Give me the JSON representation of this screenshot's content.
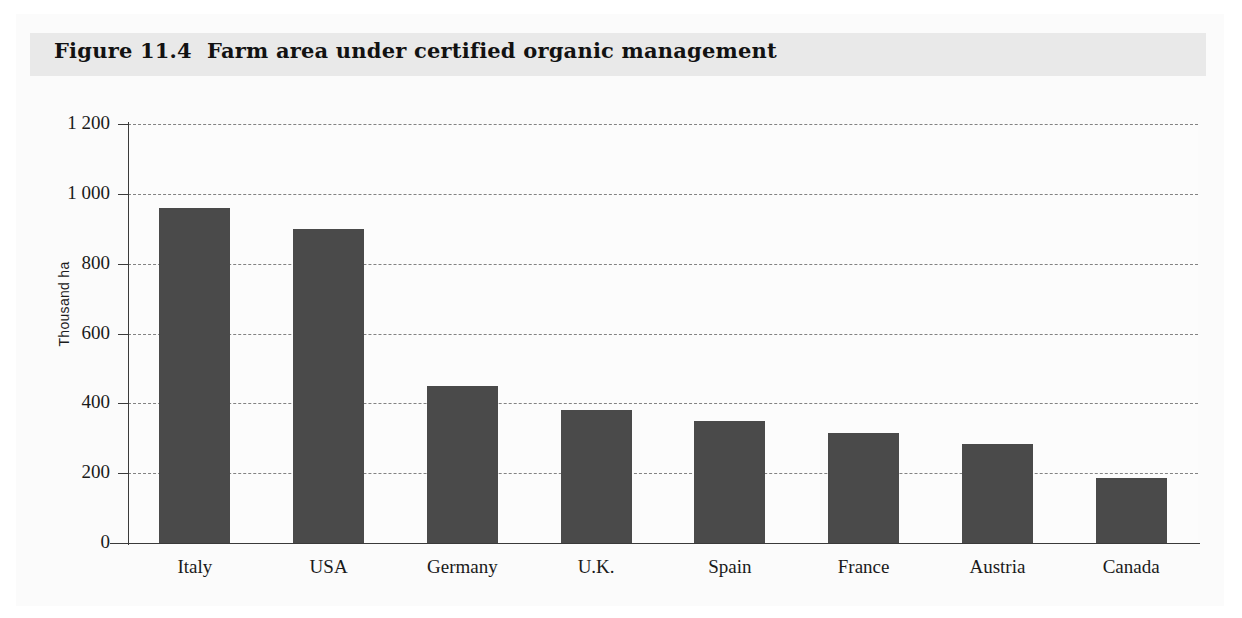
{
  "figure": {
    "title": "Figure 11.4  Farm area under certified organic management"
  },
  "chart_data": {
    "type": "bar",
    "title": "Figure 11.4  Farm area under certified organic management",
    "xlabel": "",
    "ylabel": "Thousand ha",
    "categories": [
      "Italy",
      "USA",
      "Germany",
      "U.K.",
      "Spain",
      "France",
      "Austria",
      "Canada"
    ],
    "values": [
      960,
      900,
      450,
      380,
      350,
      315,
      285,
      185
    ],
    "ylim": [
      0,
      1200
    ],
    "ytick_values": [
      0,
      200,
      400,
      600,
      800,
      1000,
      1200
    ],
    "ytick_labels": [
      "0",
      "200",
      "400",
      "600",
      "800",
      "1 000",
      "1 200"
    ],
    "grid": "horizontal-dashed",
    "legend": "none",
    "bar_color": "#4a4a4a",
    "background_color": "#fbfbfb",
    "title_band_color": "#e9e9e9"
  }
}
